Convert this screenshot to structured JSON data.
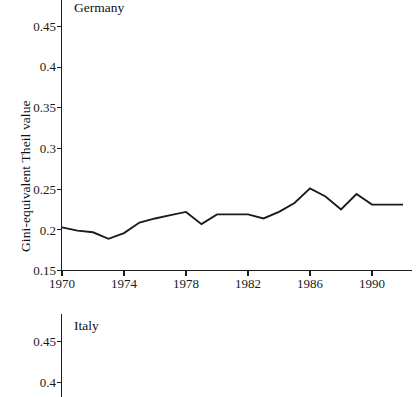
{
  "figure": {
    "panels": [
      {
        "id": "germany",
        "title": "Germany",
        "ylabel": "Gini-equivalent Theil value",
        "clipped": false
      },
      {
        "id": "italy",
        "title": "Italy",
        "ylabel": "value",
        "clipped": true
      }
    ]
  },
  "chart_data": [
    {
      "type": "line",
      "title": "Germany",
      "xlabel": "",
      "ylabel": "Gini-equivalent Theil value",
      "xlim": [
        1970,
        1992.5
      ],
      "ylim": [
        0.15,
        0.47
      ],
      "xticks": [
        1970,
        1974,
        1978,
        1982,
        1986,
        1990
      ],
      "xtick_labels": [
        "1970",
        "1974",
        "1978",
        "1982",
        "1986",
        "1990"
      ],
      "yticks": [
        0.15,
        0.2,
        0.25,
        0.3,
        0.35,
        0.4,
        0.45
      ],
      "ytick_labels": [
        "0.15",
        "0.2",
        "0.25",
        "0.3",
        "0.35",
        "0.4",
        "0.45"
      ],
      "grid": false,
      "legend": "none",
      "series": [
        {
          "name": "Germany",
          "color": "#1b1b1b",
          "x": [
            1970,
            1971,
            1972,
            1973,
            1974,
            1975,
            1976,
            1977,
            1978,
            1979,
            1980,
            1981,
            1982,
            1983,
            1984,
            1985,
            1986,
            1987,
            1988,
            1989,
            1990,
            1991,
            1992
          ],
          "values": [
            0.203,
            0.199,
            0.197,
            0.189,
            0.196,
            0.209,
            0.214,
            0.218,
            0.222,
            0.207,
            0.219,
            0.219,
            0.219,
            0.214,
            0.222,
            0.233,
            0.251,
            0.241,
            0.225,
            0.244,
            0.231,
            0.231,
            0.231
          ]
        }
      ]
    },
    {
      "type": "line",
      "title": "Italy",
      "xlabel": "",
      "ylabel": "value",
      "ylim": [
        0.38,
        0.47
      ],
      "yticks": [
        0.4,
        0.45
      ],
      "ytick_labels": [
        "0.4",
        "0.45"
      ],
      "grid": false,
      "legend": "none",
      "note": "panel cropped at bottom of image; no data line visible",
      "series": []
    }
  ]
}
